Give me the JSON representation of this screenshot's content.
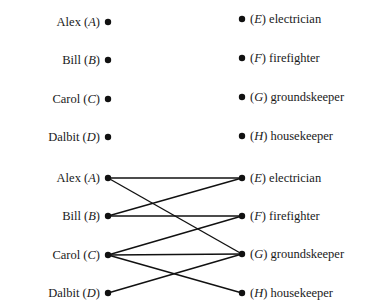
{
  "diagrams": [
    {
      "name": "unconnected-bipartite",
      "left_nodes": [
        {
          "id": "A",
          "name": "Alex",
          "y": 22
        },
        {
          "id": "B",
          "name": "Bill",
          "y": 60
        },
        {
          "id": "C",
          "name": "Carol",
          "y": 99
        },
        {
          "id": "D",
          "name": "Dalbit",
          "y": 137
        }
      ],
      "right_nodes": [
        {
          "id": "E",
          "name": "electrician",
          "y": 19
        },
        {
          "id": "F",
          "name": "firefighter",
          "y": 58
        },
        {
          "id": "G",
          "name": "groundskeeper",
          "y": 97
        },
        {
          "id": "H",
          "name": "housekeeper",
          "y": 136
        }
      ],
      "edges": []
    },
    {
      "name": "connected-bipartite",
      "left_nodes": [
        {
          "id": "A",
          "name": "Alex",
          "y": 178
        },
        {
          "id": "B",
          "name": "Bill",
          "y": 216
        },
        {
          "id": "C",
          "name": "Carol",
          "y": 255
        },
        {
          "id": "D",
          "name": "Dalbit",
          "y": 293
        }
      ],
      "right_nodes": [
        {
          "id": "E",
          "name": "electrician",
          "y": 178
        },
        {
          "id": "F",
          "name": "firefighter",
          "y": 216
        },
        {
          "id": "G",
          "name": "groundskeeper",
          "y": 254
        },
        {
          "id": "H",
          "name": "housekeeper",
          "y": 293
        }
      ],
      "edges": [
        [
          "A",
          "E"
        ],
        [
          "A",
          "G"
        ],
        [
          "B",
          "E"
        ],
        [
          "B",
          "F"
        ],
        [
          "C",
          "F"
        ],
        [
          "C",
          "G"
        ],
        [
          "C",
          "H"
        ],
        [
          "D",
          "G"
        ]
      ]
    }
  ],
  "layout": {
    "left_x": 108,
    "right_x": 242,
    "dot_radius": 3.2,
    "color": "#111111"
  }
}
